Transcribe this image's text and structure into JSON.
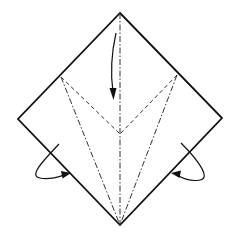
{
  "diagram": {
    "type": "origami-fold-diagram",
    "paper": {
      "shape": "square-rotated-45",
      "vertices": {
        "top": [
          120,
          13
        ],
        "right": [
          222,
          118
        ],
        "bottom": [
          120,
          225
        ],
        "left": [
          18,
          119
        ]
      },
      "edge_color": "#111111"
    },
    "crease_points": {
      "left_edge_mark": [
        61,
        77
      ],
      "right_edge_mark": [
        177,
        75
      ],
      "center_junction": [
        120,
        134
      ]
    },
    "creases": [
      {
        "name": "center-mountain-fold",
        "kind": "mountain",
        "from": [
          120,
          13
        ],
        "to": [
          120,
          225
        ]
      },
      {
        "name": "left-valley-fold",
        "kind": "valley",
        "from": [
          61,
          77
        ],
        "to": [
          120,
          134
        ]
      },
      {
        "name": "right-valley-fold",
        "kind": "valley",
        "from": [
          177,
          75
        ],
        "to": [
          120,
          134
        ]
      },
      {
        "name": "left-mountain-fold",
        "kind": "mountain",
        "from": [
          61,
          77
        ],
        "to": [
          120,
          225
        ]
      },
      {
        "name": "right-mountain-fold",
        "kind": "mountain",
        "from": [
          177,
          75
        ],
        "to": [
          120,
          225
        ]
      }
    ],
    "arrows": [
      {
        "name": "fold-down-arrow",
        "meaning": "fold top flap down",
        "path": "M116 33 Q109 64 113 98"
      },
      {
        "name": "fold-behind-left-arrow",
        "meaning": "fold behind (left)",
        "path": "M59 144 C44 160 28 176 40 178 C50 180 60 177 68 174"
      },
      {
        "name": "fold-behind-right-arrow",
        "meaning": "fold behind (right)",
        "path": "M181 143 C196 158 212 178 200 180 C190 182 180 177 174 174"
      }
    ],
    "legend": {
      "valley_fold": "dashed line",
      "mountain_fold": "dash-dot line",
      "paper_edge": "solid line"
    }
  }
}
